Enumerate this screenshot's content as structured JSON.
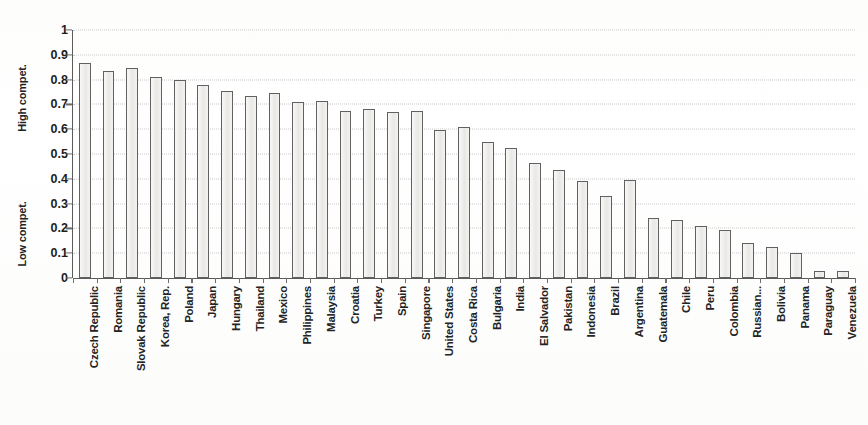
{
  "chart_data": {
    "type": "bar",
    "title": "",
    "xlabel": "",
    "ylabel": "",
    "ylim": [
      0,
      1
    ],
    "grid": true,
    "legend": "none",
    "axis_group_labels": {
      "high": "High compet.",
      "low": "Low compet."
    },
    "ytick_labels": [
      "1",
      "0.9",
      "0.8",
      "0.7",
      "0.6",
      "0.5",
      "0.4",
      "0.3",
      "0.2",
      "0.1",
      "0"
    ],
    "ytick_values": [
      1,
      0.9,
      0.8,
      0.7,
      0.6,
      0.5,
      0.4,
      0.3,
      0.2,
      0.1,
      0
    ],
    "categories": [
      "Czech Republic",
      "Romania",
      "Slovak Republic",
      "Korea, Rep.",
      "Poland",
      "Japan",
      "Hungary",
      "Thailand",
      "Mexico",
      "Philippines",
      "Malaysia",
      "Croatia",
      "Turkey",
      "Spain",
      "Singapore",
      "United States",
      "Costa Rica",
      "Bulgaria",
      "India",
      "El Salvador",
      "Pakistan",
      "Indonesia",
      "Brazil",
      "Argentina",
      "Guatemala",
      "Chile",
      "Peru",
      "Colombia",
      "Russian...",
      "Bolivia",
      "Panama",
      "Paraguay",
      "Venezuela"
    ],
    "values": [
      0.865,
      0.835,
      0.845,
      0.81,
      0.8,
      0.78,
      0.755,
      0.735,
      0.745,
      0.71,
      0.715,
      0.675,
      0.68,
      0.67,
      0.675,
      0.595,
      0.61,
      0.55,
      0.525,
      0.465,
      0.435,
      0.39,
      0.33,
      0.395,
      0.24,
      0.235,
      0.21,
      0.195,
      0.14,
      0.125,
      0.1,
      0.03,
      0.03
    ]
  }
}
